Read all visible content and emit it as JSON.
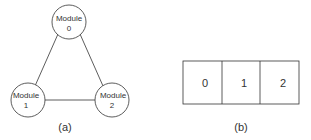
{
  "figure_a": {
    "caption": "(a)",
    "nodes": [
      {
        "line1": "Module",
        "line2": "0"
      },
      {
        "line1": "Module",
        "line2": "1"
      },
      {
        "line1": "Module",
        "line2": "2"
      }
    ]
  },
  "figure_b": {
    "caption": "(b)",
    "cells": [
      "0",
      "1",
      "2"
    ]
  }
}
